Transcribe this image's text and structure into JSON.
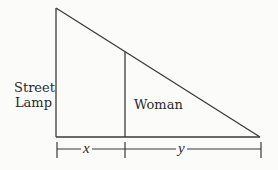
{
  "diagram": {
    "labels": {
      "lamp_line1": "Street",
      "lamp_line2": "Lamp",
      "woman": "Woman",
      "x": "x",
      "y": "y"
    },
    "colors": {
      "line": "#3a3a3a",
      "background": "#fbfbfa",
      "text": "#2a2a2a"
    }
  }
}
